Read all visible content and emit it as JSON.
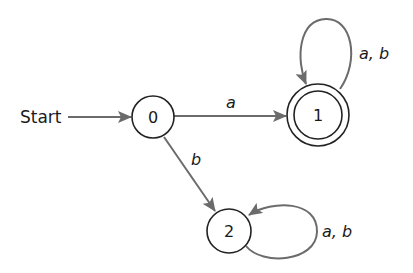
{
  "diagram": {
    "type": "finite-automaton",
    "start_label": "Start",
    "start_state": "0",
    "states": [
      {
        "id": "0",
        "label": "0",
        "accepting": false,
        "cx": 153,
        "cy": 117,
        "r": 21
      },
      {
        "id": "1",
        "label": "1",
        "accepting": true,
        "cx": 318,
        "cy": 115,
        "r": 31,
        "inner_r": 24
      },
      {
        "id": "2",
        "label": "2",
        "accepting": false,
        "cx": 229,
        "cy": 231,
        "r": 22
      }
    ],
    "transitions": [
      {
        "from": "0",
        "to": "1",
        "label": "a"
      },
      {
        "from": "0",
        "to": "2",
        "label": "b"
      },
      {
        "from": "1",
        "to": "1",
        "label": "a, b"
      },
      {
        "from": "2",
        "to": "2",
        "label": "a, b"
      }
    ],
    "colors": {
      "state_stroke": "#222222",
      "edge_stroke": "#6b6b6b",
      "text": "#1a1a1a",
      "background": "#ffffff"
    }
  }
}
